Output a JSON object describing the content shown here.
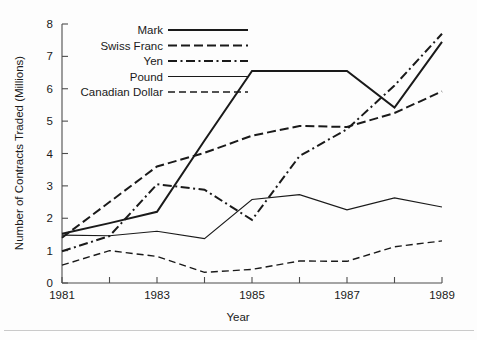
{
  "figure": {
    "background_color": "#fdfdfd",
    "ink_color": "#1a1a1a"
  },
  "axes": {
    "y_axis_title": "Number of Contracts Traded (Millions)",
    "x_axis_title": "Year",
    "y_tick_labels": [
      "0",
      "1",
      "2",
      "3",
      "4",
      "5",
      "6",
      "7",
      "8"
    ],
    "x_tick_labels": [
      "1981",
      "1983",
      "1985",
      "1987",
      "1989"
    ]
  },
  "legend": {
    "entries": [
      {
        "label": "Mark",
        "style": "solid"
      },
      {
        "label": "Swiss Franc",
        "style": "dashed"
      },
      {
        "label": "Yen",
        "style": "dashdot"
      },
      {
        "label": "Pound",
        "style": "solid-thin"
      },
      {
        "label": "Canadian Dollar",
        "style": "dashed-thin"
      }
    ]
  },
  "chart_data": {
    "type": "line",
    "title": "",
    "xlabel": "Year",
    "ylabel": "Number of Contracts Traded (Millions)",
    "x": [
      1981,
      1982,
      1983,
      1984,
      1985,
      1986,
      1987,
      1988,
      1989
    ],
    "xlim": [
      1981,
      1989
    ],
    "ylim": [
      0,
      8
    ],
    "xticks": [
      1981,
      1982,
      1983,
      1984,
      1985,
      1986,
      1987,
      1988,
      1989
    ],
    "xtick_labels": [
      "1981",
      "",
      "1983",
      "",
      "1985",
      "",
      "1987",
      "",
      "1989"
    ],
    "yticks": [
      0,
      1,
      2,
      3,
      4,
      5,
      6,
      7,
      8
    ],
    "grid": false,
    "legend_position": "upper-left-inside",
    "series": [
      {
        "name": "Mark",
        "style": "solid",
        "values": [
          1.52,
          1.85,
          2.2,
          4.4,
          6.55,
          6.55,
          6.55,
          5.42,
          7.45
        ]
      },
      {
        "name": "Swiss Franc",
        "style": "dashed",
        "values": [
          1.4,
          2.5,
          3.6,
          4.02,
          4.55,
          4.85,
          4.82,
          5.25,
          5.92
        ]
      },
      {
        "name": "Yen",
        "style": "dashdot",
        "values": [
          0.98,
          1.45,
          3.05,
          2.88,
          1.95,
          3.92,
          4.75,
          6.1,
          7.7
        ]
      },
      {
        "name": "Pound",
        "style": "solid-thin",
        "values": [
          1.48,
          1.46,
          1.6,
          1.37,
          2.58,
          2.73,
          2.26,
          2.63,
          2.35
        ]
      },
      {
        "name": "Canadian Dollar",
        "style": "dashed-thin",
        "values": [
          0.55,
          1.0,
          0.82,
          0.33,
          0.42,
          0.68,
          0.67,
          1.12,
          1.3
        ]
      }
    ]
  }
}
